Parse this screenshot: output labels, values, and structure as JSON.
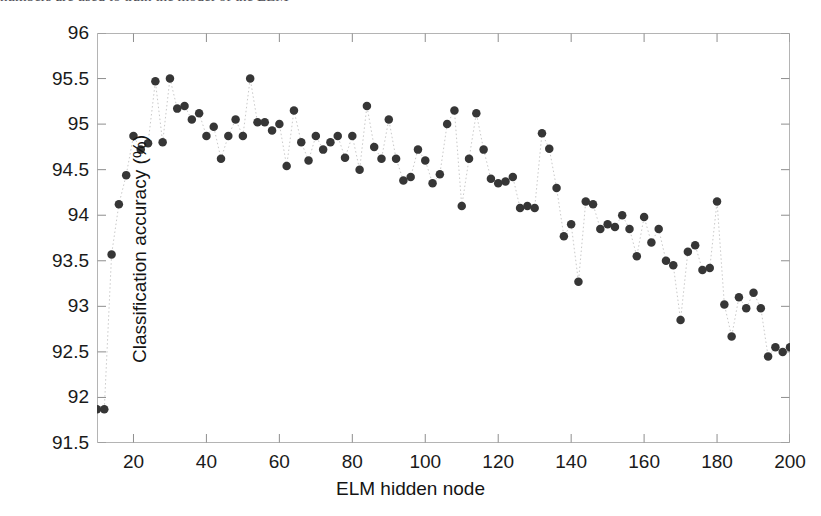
{
  "figure": {
    "top_cut_text": "numbers are used to train the model of the ELM"
  },
  "chart_data": {
    "type": "scatter",
    "title": "",
    "xlabel": "ELM hidden node",
    "ylabel": "Classification accuracy (%)",
    "xlim": [
      10,
      200
    ],
    "ylim": [
      91.5,
      96
    ],
    "xticks": [
      20,
      40,
      60,
      80,
      100,
      120,
      140,
      160,
      180,
      200
    ],
    "yticks": [
      91.5,
      92,
      92.5,
      93,
      93.5,
      94,
      94.5,
      95,
      95.5,
      96
    ],
    "grid": false,
    "legend": null,
    "marker": {
      "shape": "circle",
      "color": "#363636",
      "size": 8.5
    },
    "line": {
      "style": "dotted",
      "color": "#c9c9c9",
      "width": 1
    },
    "x": [
      10,
      12,
      14,
      16,
      18,
      20,
      22,
      24,
      26,
      28,
      30,
      32,
      34,
      36,
      38,
      40,
      42,
      44,
      46,
      48,
      50,
      52,
      54,
      56,
      58,
      60,
      62,
      64,
      66,
      68,
      70,
      72,
      74,
      76,
      78,
      80,
      82,
      84,
      86,
      88,
      90,
      92,
      94,
      96,
      98,
      100,
      102,
      104,
      106,
      108,
      110,
      112,
      114,
      116,
      118,
      120,
      122,
      124,
      126,
      128,
      130,
      132,
      134,
      136,
      138,
      140,
      142,
      144,
      146,
      148,
      150,
      152,
      154,
      156,
      158,
      160,
      162,
      164,
      166,
      168,
      170,
      172,
      174,
      176,
      178,
      180,
      182,
      184,
      186,
      188,
      190,
      192,
      194,
      196,
      198,
      200
    ],
    "y": [
      91.87,
      91.87,
      93.57,
      94.12,
      94.44,
      94.87,
      94.72,
      94.79,
      95.47,
      94.8,
      95.5,
      95.17,
      95.2,
      95.05,
      95.12,
      94.87,
      94.97,
      94.62,
      94.87,
      95.05,
      94.87,
      95.5,
      95.02,
      95.02,
      94.93,
      95.0,
      94.54,
      95.15,
      94.8,
      94.6,
      94.87,
      94.72,
      94.8,
      94.87,
      94.63,
      94.87,
      94.5,
      95.2,
      94.75,
      94.62,
      95.05,
      94.62,
      94.38,
      94.42,
      94.72,
      94.6,
      94.35,
      94.45,
      95.0,
      95.15,
      94.1,
      94.62,
      95.12,
      94.72,
      94.4,
      94.35,
      94.37,
      94.42,
      94.08,
      94.1,
      94.08,
      94.9,
      94.73,
      94.3,
      93.77,
      93.9,
      93.27,
      94.15,
      94.12,
      93.85,
      93.9,
      93.87,
      94.0,
      93.85,
      93.55,
      93.98,
      93.7,
      93.85,
      93.5,
      93.45,
      92.85,
      93.6,
      93.67,
      93.4,
      93.42,
      94.15,
      93.02,
      92.67,
      93.1,
      92.98,
      93.15,
      92.98,
      92.45,
      92.55,
      92.5,
      92.55
    ]
  }
}
